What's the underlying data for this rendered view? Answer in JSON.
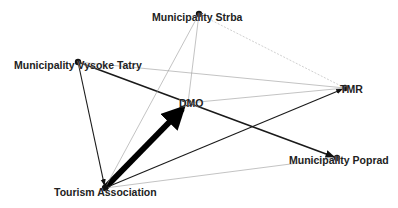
{
  "diagram": {
    "type": "directed-network",
    "nodes": [
      {
        "id": "strba",
        "label": "Municipality Strba",
        "x": 199,
        "y": 14
      },
      {
        "id": "vysoke",
        "label": "Municipality Vysoke Tatry",
        "x": 78,
        "y": 62
      },
      {
        "id": "dmo",
        "label": "DMO",
        "x": 188,
        "y": 103
      },
      {
        "id": "tmr",
        "label": "TMR",
        "x": 345,
        "y": 88
      },
      {
        "id": "poprad",
        "label": "Municipality Poprad",
        "x": 337,
        "y": 158
      },
      {
        "id": "ta",
        "label": "Tourism Association",
        "x": 105,
        "y": 188
      }
    ],
    "edges": [
      {
        "from": "ta",
        "to": "dmo",
        "weight": "very-strong",
        "width": 6,
        "color": "#000000"
      },
      {
        "from": "vysoke",
        "to": "poprad",
        "weight": "strong",
        "width": 1.6,
        "color": "#1a1a1a"
      },
      {
        "from": "vysoke",
        "to": "ta",
        "weight": "medium",
        "width": 1.1,
        "color": "#1a1a1a"
      },
      {
        "from": "ta",
        "to": "tmr",
        "weight": "medium",
        "width": 1.1,
        "color": "#1a1a1a"
      },
      {
        "from": "ta",
        "to": "poprad",
        "weight": "weak",
        "width": 0.6,
        "color": "#9a9a9a"
      },
      {
        "from": "ta",
        "to": "strba",
        "weight": "weak",
        "width": 0.6,
        "color": "#9a9a9a"
      },
      {
        "from": "dmo",
        "to": "strba",
        "weight": "weak",
        "width": 0.6,
        "color": "#9a9a9a"
      },
      {
        "from": "dmo",
        "to": "tmr",
        "weight": "weak",
        "width": 0.6,
        "color": "#9a9a9a"
      },
      {
        "from": "vysoke",
        "to": "tmr",
        "weight": "weak",
        "width": 0.6,
        "color": "#9a9a9a"
      },
      {
        "from": "strba",
        "to": "tmr",
        "weight": "weak",
        "width": 0.6,
        "color": "#b0b0b0",
        "dashed": true
      }
    ]
  },
  "labels": {
    "strba": "Municipality Strba",
    "vysoke": "Municipality Vysoke Tatry",
    "dmo": "DMO",
    "tmr": "TMR",
    "poprad": "Municipality Poprad",
    "ta": "Tourism Association"
  }
}
